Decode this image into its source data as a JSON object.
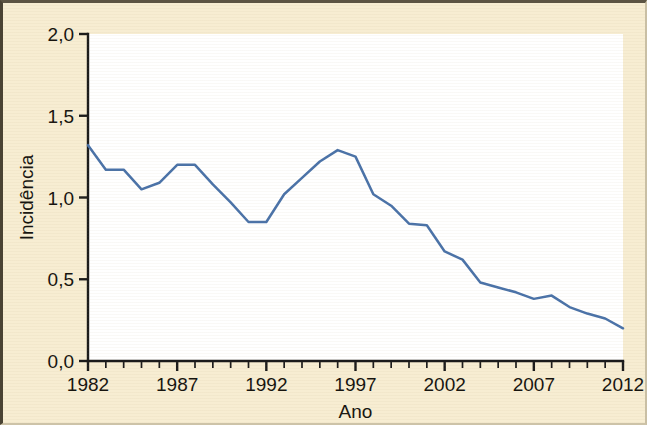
{
  "figure": {
    "background_color": "#f7edd2",
    "plot_background_color": "#ffffff",
    "border_color": "#4a4334",
    "line_color": "#4a72a8",
    "axis_color": "#1b1b1b"
  },
  "axes": {
    "y_title": "Incidência",
    "x_title": "Ano",
    "y_tick_labels": [
      "0,0",
      "0,5",
      "1,0",
      "1,5",
      "2,0"
    ],
    "y_tick_values": [
      0.0,
      0.5,
      1.0,
      1.5,
      2.0
    ],
    "x_tick_labels": [
      "1982",
      "1987",
      "1992",
      "1997",
      "2002",
      "2007",
      "2012"
    ],
    "x_tick_values": [
      1982,
      1987,
      1992,
      1997,
      2002,
      2007,
      2012
    ]
  },
  "chart_data": {
    "type": "line",
    "title": "",
    "subtitle": "",
    "xlabel": "Ano",
    "ylabel": "Incidência",
    "xlim": [
      1982,
      2012
    ],
    "ylim": [
      0.0,
      2.0
    ],
    "grid": false,
    "legend": null,
    "legend_position": "none",
    "decimal_separator": ",",
    "x": [
      1982,
      1983,
      1984,
      1985,
      1986,
      1987,
      1988,
      1989,
      1990,
      1991,
      1992,
      1993,
      1994,
      1995,
      1996,
      1997,
      1998,
      1999,
      2000,
      2001,
      2002,
      2003,
      2004,
      2005,
      2006,
      2007,
      2008,
      2009,
      2010,
      2011,
      2012
    ],
    "values": [
      1.32,
      1.17,
      1.17,
      1.05,
      1.09,
      1.2,
      1.2,
      1.08,
      0.97,
      0.85,
      0.85,
      1.02,
      1.12,
      1.22,
      1.29,
      1.25,
      1.02,
      0.95,
      0.84,
      0.83,
      0.67,
      0.62,
      0.48,
      0.45,
      0.42,
      0.38,
      0.4,
      0.33,
      0.29,
      0.26,
      0.2
    ],
    "series": [
      {
        "name": "Incidência",
        "color": "#4a72a8",
        "values": [
          1.32,
          1.17,
          1.17,
          1.05,
          1.09,
          1.2,
          1.2,
          1.08,
          0.97,
          0.85,
          0.85,
          1.02,
          1.12,
          1.22,
          1.29,
          1.25,
          1.02,
          0.95,
          0.84,
          0.83,
          0.67,
          0.62,
          0.48,
          0.45,
          0.42,
          0.38,
          0.4,
          0.33,
          0.29,
          0.26,
          0.2
        ]
      }
    ]
  },
  "geometry": {
    "plot_left": 85,
    "plot_right": 620,
    "plot_top": 31,
    "plot_bottom": 358
  }
}
